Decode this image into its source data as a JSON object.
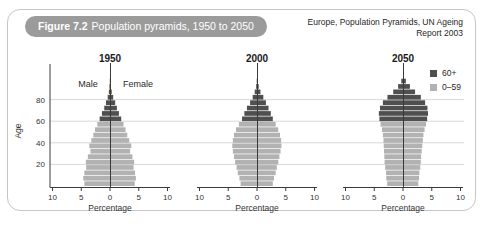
{
  "header": {
    "figure_label": "Figure 7.2",
    "figure_title": "Population pyramids, 1950 to 2050",
    "source_line1": "Europe, Population Pyramids, UN Ageing",
    "source_line2": "Report 2003"
  },
  "axes": {
    "age_label": "Age",
    "age_ticks": [
      20,
      40,
      60,
      80
    ],
    "pct_label": "Percentage",
    "pct_ticks": [
      "10",
      "5",
      "0",
      "5",
      "10"
    ],
    "male_label": "Male",
    "female_label": "Female"
  },
  "legend": {
    "items": [
      {
        "label": "60+",
        "color": "#4f4f4f"
      },
      {
        "label": "0–59",
        "color": "#b2b2b2"
      }
    ]
  },
  "colors": {
    "band_60plus": "#4f4f4f",
    "band_0_59": "#b2b2b2",
    "gridline": "#d8d8d8",
    "axis": "#3a3a3a",
    "text": "#333333",
    "header_pill_bg": "#9b9b9b",
    "header_pill_text": "#ffffff",
    "card_border": "#c6c6c6"
  },
  "chart_data": [
    {
      "type": "bar",
      "variant": "population-pyramid",
      "title": "1950",
      "xlabel": "Percentage",
      "ylabel": "Age",
      "xlim": [
        -10,
        10
      ],
      "ylim": [
        0,
        100
      ],
      "units": "percent of total population per 5-year band per sex",
      "split_age": 60,
      "age_groups": [
        "0–4",
        "5–9",
        "10–14",
        "15–19",
        "20–24",
        "25–29",
        "30–34",
        "35–39",
        "40–44",
        "45–49",
        "50–54",
        "55–59",
        "60–64",
        "65–69",
        "70–74",
        "75–79",
        "80–84",
        "85–89",
        "90–94",
        "95–99"
      ],
      "series": [
        {
          "name": "Male",
          "values": [
            4.45,
            4.65,
            4.45,
            4.15,
            4.2,
            3.85,
            3.4,
            3.6,
            3.25,
            2.9,
            2.6,
            2.2,
            1.8,
            1.4,
            1.0,
            0.7,
            0.4,
            0.2,
            0.1,
            0.04
          ]
        },
        {
          "name": "Female",
          "values": [
            4.3,
            4.5,
            4.35,
            4.1,
            4.2,
            3.9,
            3.5,
            3.7,
            3.35,
            3.0,
            2.7,
            2.35,
            1.95,
            1.55,
            1.2,
            0.9,
            0.55,
            0.3,
            0.15,
            0.06
          ]
        }
      ]
    },
    {
      "type": "bar",
      "variant": "population-pyramid",
      "title": "2000",
      "xlabel": "Percentage",
      "ylabel": "Age",
      "xlim": [
        -10,
        10
      ],
      "ylim": [
        0,
        100
      ],
      "units": "percent of total population per 5-year band per sex",
      "split_age": 60,
      "age_groups": [
        "0–4",
        "5–9",
        "10–14",
        "15–19",
        "20–24",
        "25–29",
        "30–34",
        "35–39",
        "40–44",
        "45–49",
        "50–54",
        "55–59",
        "60–64",
        "65–69",
        "70–74",
        "75–79",
        "80–84",
        "85–89",
        "90–94",
        "95–99"
      ],
      "series": [
        {
          "name": "Male",
          "values": [
            2.85,
            3.05,
            3.35,
            3.55,
            3.8,
            4.0,
            4.2,
            4.3,
            4.2,
            4.0,
            3.65,
            3.15,
            2.6,
            2.2,
            1.75,
            1.2,
            0.75,
            0.4,
            0.15,
            0.05
          ]
        },
        {
          "name": "Female",
          "values": [
            2.75,
            2.95,
            3.25,
            3.45,
            3.7,
            3.9,
            4.1,
            4.25,
            4.2,
            4.0,
            3.7,
            3.25,
            2.75,
            2.4,
            2.0,
            1.55,
            1.1,
            0.6,
            0.3,
            0.12
          ]
        }
      ]
    },
    {
      "type": "bar",
      "variant": "population-pyramid",
      "title": "2050",
      "xlabel": "Percentage",
      "ylabel": "Age",
      "xlim": [
        -10,
        10
      ],
      "ylim": [
        0,
        100
      ],
      "units": "percent of total population per 5-year band per sex",
      "split_age": 60,
      "age_groups": [
        "0–4",
        "5–9",
        "10–14",
        "15–19",
        "20–24",
        "25–29",
        "30–34",
        "35–39",
        "40–44",
        "45–49",
        "50–54",
        "55–59",
        "60–64",
        "65–69",
        "70–74",
        "75–79",
        "80–84",
        "85–89",
        "90–94",
        "95–99"
      ],
      "series": [
        {
          "name": "Male",
          "values": [
            2.75,
            2.9,
            2.95,
            3.1,
            3.2,
            3.25,
            3.3,
            3.35,
            3.4,
            3.5,
            3.65,
            3.9,
            4.1,
            4.2,
            4.0,
            3.5,
            2.7,
            1.7,
            0.85,
            0.3
          ]
        },
        {
          "name": "Female",
          "values": [
            2.65,
            2.8,
            2.85,
            3.0,
            3.1,
            3.15,
            3.25,
            3.35,
            3.45,
            3.55,
            3.75,
            4.0,
            4.2,
            4.35,
            4.25,
            3.85,
            3.1,
            2.1,
            1.2,
            0.5
          ]
        }
      ]
    }
  ]
}
